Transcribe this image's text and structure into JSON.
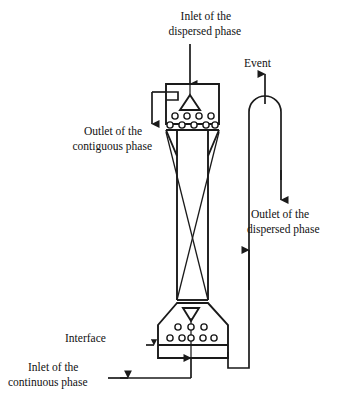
{
  "figure": {
    "background_color": "#ffffff",
    "line_color": "#1a1a1a"
  },
  "labels": {
    "inlet_dispersed_line1": "Inlet of the",
    "inlet_dispersed_line2": "dispersed phase",
    "event": "Event",
    "outlet_contiguous_line1": "Outlet of the",
    "outlet_contiguous_line2": "contiguous phase",
    "outlet_dispersed_line1": "Outlet of the",
    "outlet_dispersed_line2": "dispersed phase",
    "interface": "Interface",
    "inlet_continuous_line1": "Inlet of the",
    "inlet_continuous_line2": "continuous phase"
  },
  "components": {
    "top_chamber": "top-distributor-chamber",
    "bottom_chamber": "bottom-distributor-chamber",
    "column_shaft": "column-shaft",
    "top_distributor_triangle": "top-distributor-nozzle",
    "bottom_distributor_triangle": "bottom-distributor-nozzle",
    "interface_line": "interface-level-line",
    "vent_loop": "vent-u-bend-pipe",
    "return_pipe": "dispersed-phase-return-pipe",
    "mixer_cross": "packing-cross-internals"
  },
  "hole_rows": {
    "top_row_1_count": 4,
    "top_row_2_count": 5,
    "bottom_row_1_count": 3,
    "bottom_row_2_count": 5
  }
}
